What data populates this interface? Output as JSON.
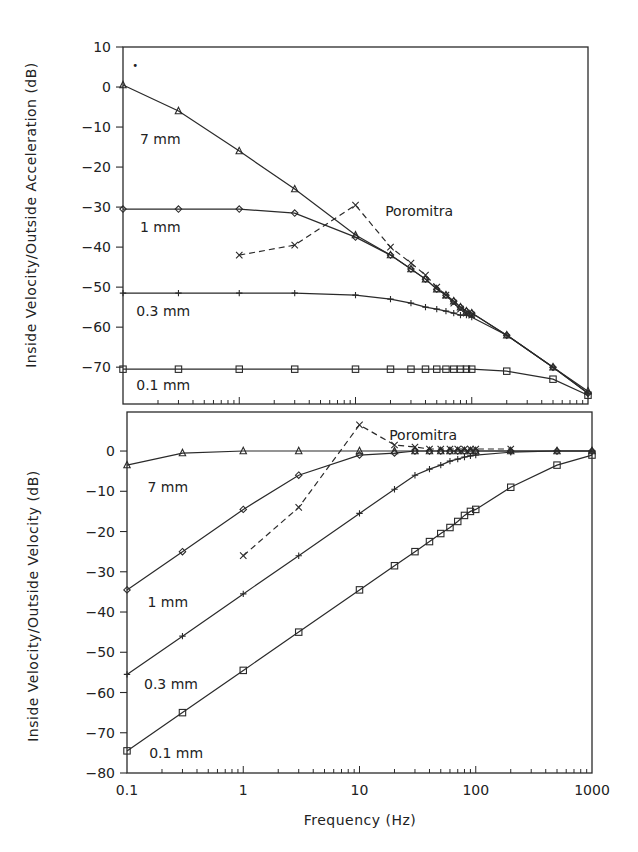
{
  "chart_data": [
    {
      "type": "line",
      "panel": "top",
      "title": "",
      "xlabel": "",
      "ylabel": "Inside Velocity/Outside Acceleration (dB)",
      "xscale": "log",
      "xlim": [
        0.1,
        1000
      ],
      "ylim": [
        -79,
        10
      ],
      "yticks": [
        10,
        0,
        -10,
        -20,
        -30,
        -40,
        -50,
        -60,
        -70
      ],
      "ytick_labels": [
        "10",
        "0",
        "−10",
        "−20",
        "−30",
        "−40",
        "−50",
        "−60",
        "−70"
      ],
      "grid": false,
      "series": [
        {
          "name": "7 mm",
          "label": "7 mm",
          "marker": "triangle",
          "dashed": false,
          "x": [
            0.1,
            0.3,
            1,
            3,
            10,
            20,
            30,
            40,
            50,
            60,
            70,
            80,
            90,
            100,
            200,
            500,
            1000
          ],
          "y": [
            0.5,
            -6,
            -16,
            -25.5,
            -37,
            -42,
            -45.5,
            -48,
            -50.5,
            -52,
            -53.5,
            -55,
            -56,
            -56.5,
            -62,
            -70,
            -76
          ],
          "label_pos": {
            "x": 0.14,
            "y": -13
          }
        },
        {
          "name": "1 mm",
          "label": "1 mm",
          "marker": "diamond",
          "dashed": false,
          "x": [
            0.1,
            0.3,
            1,
            3,
            10,
            20,
            30,
            40,
            50,
            60,
            70,
            80,
            90,
            100,
            200,
            500,
            1000
          ],
          "y": [
            -30.5,
            -30.5,
            -30.5,
            -31.5,
            -37.5,
            -42,
            -45.5,
            -48,
            -50.5,
            -52,
            -53.5,
            -55,
            -56,
            -56.5,
            -62,
            -70,
            -76.5
          ],
          "label_pos": {
            "x": 0.14,
            "y": -35
          }
        },
        {
          "name": "0.3 mm",
          "label": "0.3 mm",
          "marker": "plus",
          "dashed": false,
          "x": [
            0.1,
            0.3,
            1,
            3,
            10,
            20,
            30,
            40,
            50,
            60,
            70,
            80,
            90,
            100,
            200,
            500,
            1000
          ],
          "y": [
            -51.5,
            -51.5,
            -51.5,
            -51.5,
            -52,
            -53,
            -54,
            -55,
            -55.5,
            -56,
            -56.5,
            -57,
            -57,
            -57.5,
            -62,
            -70,
            -76.5
          ],
          "label_pos": {
            "x": 0.13,
            "y": -56
          }
        },
        {
          "name": "0.1 mm",
          "label": "0.1 mm",
          "marker": "square",
          "dashed": false,
          "x": [
            0.1,
            0.3,
            1,
            3,
            10,
            20,
            30,
            40,
            50,
            60,
            70,
            80,
            90,
            100,
            200,
            500,
            1000
          ],
          "y": [
            -70.5,
            -70.5,
            -70.5,
            -70.5,
            -70.5,
            -70.5,
            -70.5,
            -70.5,
            -70.5,
            -70.5,
            -70.5,
            -70.5,
            -70.5,
            -70.5,
            -71,
            -73,
            -77
          ],
          "label_pos": {
            "x": 0.13,
            "y": -74.5
          }
        },
        {
          "name": "Poromitra",
          "label": "Poromitra",
          "marker": "x",
          "dashed": true,
          "x": [
            1,
            3,
            10,
            20,
            30,
            40,
            50,
            60,
            70,
            80,
            90,
            100
          ],
          "y": [
            -42,
            -39.5,
            -29.5,
            -40,
            -44,
            -47,
            -50,
            -52,
            -54,
            -55.5,
            -56.5,
            -57
          ],
          "label_pos": {
            "x": 18,
            "y": -31
          }
        }
      ],
      "annotations": [
        {
          "text": "•",
          "x": 0.12,
          "y": 4.5
        }
      ]
    },
    {
      "type": "line",
      "panel": "bottom",
      "title": "",
      "xlabel": "Frequency (Hz)",
      "ylabel": "Inside Velocity/Outside Velocity (dB)",
      "xscale": "log",
      "xlim": [
        0.1,
        1000
      ],
      "xticks": [
        0.1,
        1,
        10,
        100,
        1000
      ],
      "xtick_labels": [
        "0.1",
        "1",
        "10",
        "100",
        "1000"
      ],
      "ylim": [
        -80,
        10
      ],
      "yticks": [
        0,
        -10,
        -20,
        -30,
        -40,
        -50,
        -60,
        -70,
        -80
      ],
      "ytick_labels": [
        "0",
        "−10",
        "−20",
        "−30",
        "−40",
        "−50",
        "−60",
        "−70",
        "−80"
      ],
      "grid": false,
      "series": [
        {
          "name": "7 mm",
          "label": "7 mm",
          "marker": "triangle",
          "dashed": false,
          "x": [
            0.1,
            0.3,
            1,
            3,
            10,
            20,
            30,
            40,
            50,
            60,
            70,
            80,
            90,
            100,
            200,
            500,
            1000
          ],
          "y": [
            -3.5,
            -0.5,
            0,
            0,
            0,
            0,
            0,
            0,
            0,
            0,
            0,
            0,
            0,
            0,
            0,
            0,
            0
          ],
          "label_pos": {
            "x": 0.15,
            "y": -9
          }
        },
        {
          "name": "1 mm",
          "label": "1 mm",
          "marker": "diamond",
          "dashed": false,
          "x": [
            0.1,
            0.3,
            1,
            3,
            10,
            20,
            30,
            40,
            50,
            60,
            70,
            80,
            90,
            100,
            200,
            500,
            1000
          ],
          "y": [
            -34.5,
            -25,
            -14.5,
            -6,
            -1,
            -0.5,
            0,
            0,
            0,
            0,
            0,
            0,
            0,
            0,
            0,
            0,
            0
          ],
          "label_pos": {
            "x": 0.15,
            "y": -37.5
          }
        },
        {
          "name": "0.3 mm",
          "label": "0.3 mm",
          "marker": "plus",
          "dashed": false,
          "x": [
            0.1,
            0.3,
            1,
            3,
            10,
            20,
            30,
            40,
            50,
            60,
            70,
            80,
            90,
            100,
            200,
            500,
            1000
          ],
          "y": [
            -55.5,
            -46,
            -35.5,
            -26,
            -15.5,
            -9.5,
            -6,
            -4.5,
            -3.5,
            -2.5,
            -2,
            -1.5,
            -1.2,
            -1,
            -0.3,
            0,
            0
          ],
          "label_pos": {
            "x": 0.14,
            "y": -58
          }
        },
        {
          "name": "0.1 mm",
          "label": "0.1 mm",
          "marker": "square",
          "dashed": false,
          "x": [
            0.1,
            0.3,
            1,
            3,
            10,
            20,
            30,
            40,
            50,
            60,
            70,
            80,
            90,
            100,
            200,
            500,
            1000
          ],
          "y": [
            -74.5,
            -65,
            -54.5,
            -45,
            -34.5,
            -28.5,
            -25,
            -22.5,
            -20.5,
            -19,
            -17.5,
            -16,
            -15,
            -14.5,
            -9,
            -3.5,
            -1
          ],
          "label_pos": {
            "x": 0.155,
            "y": -75
          }
        },
        {
          "name": "Poromitra",
          "label": "Poromitra",
          "marker": "x",
          "dashed": true,
          "x": [
            1,
            3,
            10,
            20,
            30,
            40,
            50,
            60,
            70,
            80,
            90,
            100,
            200
          ],
          "y": [
            -26,
            -14,
            6.5,
            1.5,
            1,
            0.5,
            0.5,
            0.5,
            0.5,
            0.5,
            0.5,
            0.5,
            0.5
          ],
          "label_pos": {
            "x": 18,
            "y": 4
          }
        }
      ]
    }
  ]
}
